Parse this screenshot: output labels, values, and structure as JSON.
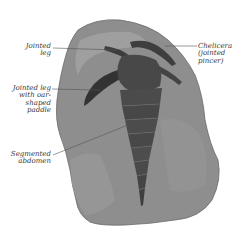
{
  "figure": {
    "colors": {
      "background": "#ffffff",
      "rock": "#8e8e8e",
      "rock_light": "#a6a6a6",
      "rock_dark": "#6f6f6f",
      "body": "#4a4a4a",
      "body_dark": "#333333",
      "segment_line": "#7a7a7a",
      "leader_line": "#555555",
      "label_text": "#3a3a3a"
    },
    "labels": {
      "jointed_leg": "Jointed\nleg",
      "paddle_leg": "Jointed leg\nwith oar-\nshaped\npaddle",
      "abdomen": "Segmented\nabdomen",
      "chelicera": "Chelicera\n(jointed\npincer)"
    }
  }
}
